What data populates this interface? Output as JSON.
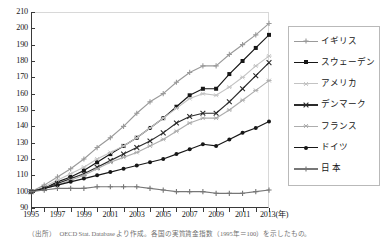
{
  "chart_data": {
    "type": "line",
    "title": "",
    "xlabel": "(年)",
    "ylabel": "",
    "ylim": [
      90,
      210
    ],
    "ytick_step": 10,
    "yticks": [
      90,
      100,
      110,
      120,
      130,
      140,
      150,
      160,
      170,
      180,
      190,
      200,
      210
    ],
    "xlim": [
      1995,
      2013
    ],
    "xticks": [
      1995,
      1996,
      1997,
      1998,
      1999,
      2000,
      2001,
      2002,
      2003,
      2004,
      2005,
      2006,
      2007,
      2008,
      2009,
      2010,
      2011,
      2012,
      2013
    ],
    "xtick_labels": [
      "1995",
      "",
      "1997",
      "",
      "1999",
      "",
      "2001",
      "",
      "2003",
      "",
      "2005",
      "",
      "2007",
      "",
      "2009",
      "",
      "2011",
      "",
      "2013(年)"
    ],
    "x": [
      1995,
      1996,
      1997,
      1998,
      1999,
      2000,
      2001,
      2002,
      2003,
      2004,
      2005,
      2006,
      2007,
      2008,
      2009,
      2010,
      2011,
      2012,
      2013
    ],
    "grid": false,
    "legend_position": "right",
    "series": [
      {
        "name": "イギリス",
        "color": "#9a9a9a",
        "marker": "plus",
        "values": [
          100,
          104,
          109,
          114,
          120,
          127,
          133,
          140,
          148,
          155,
          160,
          167,
          173,
          177,
          177,
          184,
          190,
          196,
          203
        ]
      },
      {
        "name": "スウェーデン",
        "color": "#171717",
        "marker": "square",
        "values": [
          100,
          102,
          106,
          109,
          113,
          118,
          123,
          128,
          133,
          139,
          145,
          152,
          159,
          163,
          163,
          172,
          180,
          188,
          196
        ]
      },
      {
        "name": "アメリカ",
        "color": "#c3c3c3",
        "marker": "star",
        "values": [
          100,
          103,
          107,
          111,
          115,
          120,
          124,
          128,
          133,
          139,
          145,
          151,
          157,
          160,
          159,
          164,
          170,
          177,
          183
        ]
      },
      {
        "name": "デンマーク",
        "color": "#2b2b2b",
        "marker": "cross",
        "values": [
          100,
          102,
          105,
          108,
          111,
          115,
          119,
          123,
          127,
          131,
          136,
          142,
          146,
          148,
          148,
          155,
          163,
          171,
          179
        ]
      },
      {
        "name": "フランス",
        "color": "#adadad",
        "marker": "asterisk",
        "values": [
          100,
          102,
          104,
          107,
          110,
          114,
          118,
          121,
          124,
          128,
          132,
          137,
          142,
          145,
          145,
          150,
          156,
          162,
          168
        ]
      },
      {
        "name": "ドイツ",
        "color": "#171717",
        "marker": "circle",
        "values": [
          100,
          102,
          104,
          106,
          108,
          110,
          112,
          114,
          116,
          118,
          120,
          123,
          126,
          129,
          128,
          132,
          136,
          139,
          143
        ]
      },
      {
        "name": "日 本",
        "color": "#777777",
        "marker": "plus",
        "values": [
          100,
          101,
          102,
          102,
          102,
          103,
          103,
          103,
          103,
          102,
          101,
          100,
          100,
          100,
          99,
          99,
          99,
          100,
          101
        ]
      }
    ]
  },
  "caption": "（出所）　OECD Stat. Database より作成。各国の実質賃金指数（1995年＝100）を示したもの。"
}
